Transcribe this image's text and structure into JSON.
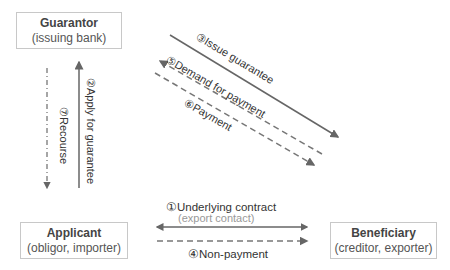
{
  "nodes": {
    "guarantor": {
      "title": "Guarantor",
      "subtitle": "(issuing bank)"
    },
    "applicant": {
      "title": "Applicant",
      "subtitle": "(obligor, importer)"
    },
    "beneficiary": {
      "title": "Beneficiary",
      "subtitle": "(creditor, exporter)"
    }
  },
  "edges": {
    "e1": {
      "label": "①Underlying contract",
      "sublabel": "(export contact)",
      "style": "solid",
      "direction": "both"
    },
    "e2": {
      "label": "②Apply for guarantee",
      "style": "solid",
      "direction": "applicant-to-guarantor"
    },
    "e3": {
      "label": "③Issue guarantee",
      "style": "solid",
      "direction": "guarantor-to-beneficiary"
    },
    "e4": {
      "label": "④Non-payment",
      "style": "dashed",
      "direction": "applicant-to-beneficiary"
    },
    "e5": {
      "label": "⑤Demand for payment",
      "style": "dashed",
      "direction": "beneficiary-to-guarantor"
    },
    "e6": {
      "label": "⑥Payment",
      "style": "dashed",
      "direction": "guarantor-to-beneficiary"
    },
    "e7": {
      "label": "⑦Recourse",
      "style": "dash-dot",
      "direction": "guarantor-to-applicant"
    }
  },
  "colors": {
    "line": "#666666",
    "border": "#c8c8c8",
    "sublabel": "#999999"
  }
}
